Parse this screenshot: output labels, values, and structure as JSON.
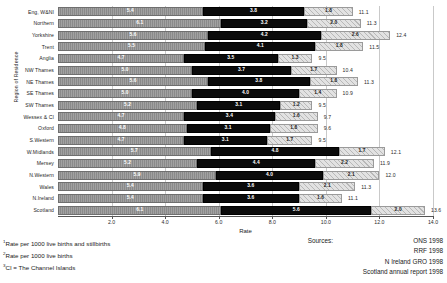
{
  "chart_data": {
    "type": "bar",
    "orientation": "horizontal",
    "stacked": true,
    "title": "",
    "xlabel": "Rate",
    "ylabel": "Region of Residence",
    "xlim": [
      0,
      14.0
    ],
    "grid": true,
    "legend_position": "none",
    "xticks": [
      "2.0",
      "4.0",
      "6.0",
      "8.0",
      "10.0",
      "12.0",
      "14.0"
    ],
    "xtick_values": [
      2.0,
      4.0,
      6.0,
      8.0,
      10.0,
      12.0,
      14.0
    ],
    "categories": [
      "Eng, W&NI",
      "Northern",
      "Yorkshire",
      "Trent",
      "Anglia",
      "NW Thames",
      "NE Thames",
      "SE Thames",
      "SW Thames",
      "Wessex & CI",
      "Oxford",
      "S.Western",
      "W.Midlands",
      "Mersey",
      "N.Western",
      "Wales",
      "N.Ireland",
      "Scotland"
    ],
    "series": [
      {
        "name": "Stillbirths",
        "values": [
          5.4,
          6.1,
          5.6,
          5.5,
          4.7,
          5.0,
          5.6,
          5.0,
          5.2,
          4.7,
          4.8,
          4.7,
          5.7,
          5.2,
          5.9,
          5.4,
          5.4,
          6.1
        ]
      },
      {
        "name": "Early neonatal",
        "values": [
          3.8,
          3.2,
          4.2,
          4.1,
          3.5,
          3.7,
          3.8,
          4.0,
          3.1,
          3.4,
          3.1,
          3.1,
          4.8,
          4.4,
          4.0,
          3.6,
          3.6,
          5.6
        ]
      },
      {
        "name": "Late neonatal / postneonatal",
        "values": [
          1.8,
          2.0,
          2.6,
          1.8,
          1.3,
          1.7,
          1.8,
          1.4,
          1.2,
          1.6,
          1.8,
          1.7,
          1.7,
          2.2,
          2.1,
          2.1,
          1.6,
          2.0
        ]
      }
    ],
    "totals": [
      11.1,
      11.3,
      12.4,
      11.5,
      9.5,
      10.4,
      11.3,
      10.9,
      9.5,
      9.7,
      9.6,
      9.5,
      12.1,
      11.9,
      12.0,
      11.3,
      11.1,
      13.6
    ]
  },
  "footnotes": [
    "Rate per 1000 live births and stillbirths",
    "Rate per 1000 live births",
    "CI = The Channel Islands"
  ],
  "footnote_marks": [
    "1",
    "2",
    "3"
  ],
  "sources": {
    "label": "Sources:",
    "items": [
      "ONS 1998",
      "RRF 1998",
      "N Ireland GRO 1998",
      "Scotland annual report 1998"
    ]
  }
}
